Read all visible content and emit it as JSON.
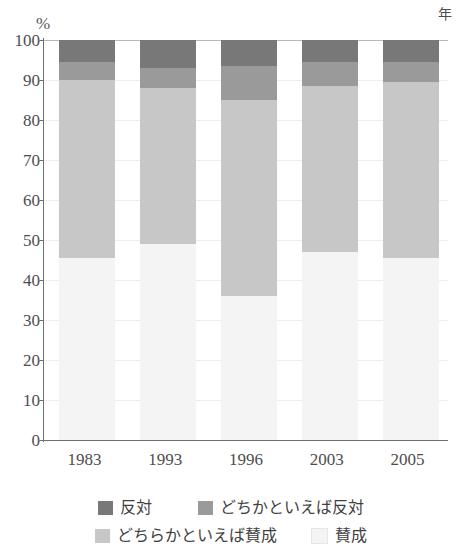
{
  "axis": {
    "unit_label": "%",
    "x_unit_label": "年",
    "y_ticks": [
      "100",
      "90",
      "80",
      "70",
      "60",
      "50",
      "40",
      "30",
      "20",
      "10",
      "0"
    ]
  },
  "legend": {
    "items": [
      {
        "label": "反対",
        "color": "#787878"
      },
      {
        "label": "どちかといえば反対",
        "color": "#9a9a9a"
      },
      {
        "label": "どちらかといえば賛成",
        "color": "#c7c7c7"
      },
      {
        "label": "賛成",
        "color": "#f4f4f4"
      }
    ]
  },
  "chart_data": {
    "type": "bar",
    "title": "",
    "subtitle": "",
    "xlabel": "年",
    "ylabel": "%",
    "ylim": [
      0,
      100
    ],
    "grid": true,
    "stacked": true,
    "legend_position": "bottom",
    "categories": [
      "1983",
      "1993",
      "1996",
      "2003",
      "2005"
    ],
    "series": [
      {
        "name": "賛成",
        "color": "#f4f4f4",
        "values": [
          45.5,
          49.0,
          36.0,
          47.0,
          45.5
        ]
      },
      {
        "name": "どちらかといえば賛成",
        "color": "#c7c7c7",
        "values": [
          44.5,
          39.0,
          49.0,
          41.5,
          44.0
        ]
      },
      {
        "name": "どちかといえば反対",
        "color": "#9a9a9a",
        "values": [
          4.5,
          5.0,
          8.5,
          6.0,
          5.0
        ]
      },
      {
        "name": "反対",
        "color": "#787878",
        "values": [
          5.5,
          7.0,
          6.5,
          5.5,
          5.5
        ]
      }
    ]
  }
}
